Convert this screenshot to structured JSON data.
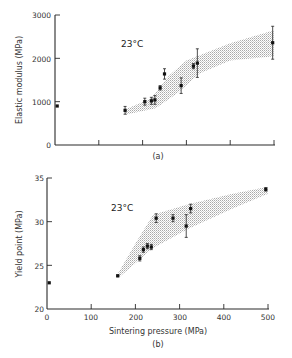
{
  "chart_data": [
    {
      "type": "scatter",
      "panel": "(a)",
      "annotation": "23°C",
      "title": "",
      "xlabel": "Sintering pressure (MPa)",
      "ylabel": "Elastic modulus (MPa)",
      "xlim": [
        0,
        500
      ],
      "ylim": [
        0,
        3000
      ],
      "xticks": [
        0,
        100,
        200,
        300,
        400,
        500
      ],
      "yticks": [
        0,
        1000,
        2000,
        3000
      ],
      "ytick_labels": [
        "0",
        "1000",
        "2000",
        "3000"
      ],
      "grid": false,
      "shaded_band": {
        "lower": [
          [
            160,
            700
          ],
          [
            230,
            850
          ],
          [
            280,
            1200
          ],
          [
            330,
            1650
          ],
          [
            400,
            1950
          ],
          [
            500,
            2050
          ]
        ],
        "upper": [
          [
            160,
            820
          ],
          [
            220,
            1080
          ],
          [
            260,
            1600
          ],
          [
            300,
            1950
          ],
          [
            400,
            2350
          ],
          [
            500,
            2650
          ]
        ]
      },
      "points": [
        {
          "x": 5,
          "y": 900,
          "err": 0
        },
        {
          "x": 160,
          "y": 800,
          "err": 90
        },
        {
          "x": 205,
          "y": 1000,
          "err": 80
        },
        {
          "x": 220,
          "y": 1020,
          "err": 80
        },
        {
          "x": 228,
          "y": 1040,
          "err": 100
        },
        {
          "x": 240,
          "y": 1320,
          "err": 50
        },
        {
          "x": 250,
          "y": 1640,
          "err": 120
        },
        {
          "x": 288,
          "y": 1370,
          "err": 180
        },
        {
          "x": 316,
          "y": 1820,
          "err": 60
        },
        {
          "x": 325,
          "y": 1890,
          "err": 330
        },
        {
          "x": 497,
          "y": 2360,
          "err": 380
        }
      ]
    },
    {
      "type": "scatter",
      "panel": "(b)",
      "annotation": "23°C",
      "title": "",
      "xlabel": "Sintering pressure (MPa)",
      "ylabel": "Yield point (MPa)",
      "xlim": [
        0,
        500
      ],
      "ylim": [
        20,
        35
      ],
      "xticks": [
        0,
        100,
        200,
        300,
        400,
        500
      ],
      "xtick_labels": [
        "0",
        "100",
        "200",
        "300",
        "400",
        "500"
      ],
      "yticks": [
        20,
        25,
        30,
        35
      ],
      "ytick_labels": [
        "20",
        "25",
        "30",
        "35"
      ],
      "grid": false,
      "shaded_band": {
        "lower": [
          [
            160,
            23.5
          ],
          [
            240,
            27.0
          ],
          [
            320,
            29.2
          ],
          [
            420,
            31.5
          ],
          [
            500,
            33.2
          ]
        ],
        "upper": [
          [
            160,
            24.0
          ],
          [
            200,
            27.5
          ],
          [
            240,
            30.8
          ],
          [
            320,
            32.0
          ],
          [
            420,
            33.2
          ],
          [
            500,
            34.0
          ]
        ]
      },
      "points": [
        {
          "x": 5,
          "y": 23.0,
          "err": 0
        },
        {
          "x": 160,
          "y": 23.8,
          "err": 0.1
        },
        {
          "x": 210,
          "y": 25.8,
          "err": 0.3
        },
        {
          "x": 218,
          "y": 26.8,
          "err": 0.3
        },
        {
          "x": 227,
          "y": 27.2,
          "err": 0.3
        },
        {
          "x": 236,
          "y": 27.1,
          "err": 0.3
        },
        {
          "x": 247,
          "y": 30.4,
          "err": 0.5
        },
        {
          "x": 285,
          "y": 30.4,
          "err": 0.4
        },
        {
          "x": 315,
          "y": 29.5,
          "err": 1.3
        },
        {
          "x": 325,
          "y": 31.5,
          "err": 0.5
        },
        {
          "x": 495,
          "y": 33.7,
          "err": 0.2
        }
      ]
    }
  ],
  "labels": {
    "a_ylabel": "Elastic modulus (MPa)",
    "a_panel": "(a)",
    "a_temp": "23°C",
    "b_ylabel": "Yield point (MPa)",
    "b_xlabel": "Sintering pressure (MPa)",
    "b_panel": "(b)",
    "b_temp": "23°C",
    "a_y0": "0",
    "a_y1": "1000",
    "a_y2": "2000",
    "a_y3": "3000",
    "b_y0": "20",
    "b_y1": "25",
    "b_y2": "30",
    "b_y3": "35",
    "b_x0": "0",
    "b_x1": "100",
    "b_x2": "200",
    "b_x3": "300",
    "b_x4": "400",
    "b_x5": "500"
  }
}
